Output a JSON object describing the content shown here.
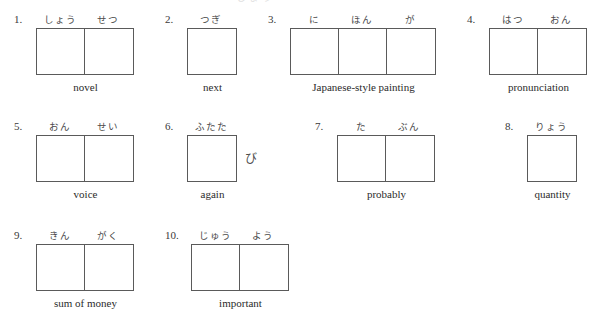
{
  "page": {
    "top_clipped_text": "しょう",
    "cell_width_px": 48,
    "cell_height_px": 45,
    "border_color": "#5a5a5a",
    "background_color": "#ffffff",
    "text_color": "#2b2b2b"
  },
  "items": [
    {
      "number": "1.",
      "furigana": [
        "しょう",
        "せつ"
      ],
      "cells": 2,
      "okurigana": "",
      "meaning": "novel",
      "left": 14,
      "top": 12
    },
    {
      "number": "2.",
      "furigana": [
        "つぎ"
      ],
      "cells": 1,
      "okurigana": "",
      "meaning": "next",
      "left": 165,
      "top": 12
    },
    {
      "number": "3.",
      "furigana": [
        "に",
        "ほん",
        "が"
      ],
      "cells": 3,
      "okurigana": "",
      "meaning": "Japanese-style painting",
      "left": 268,
      "top": 12
    },
    {
      "number": "4.",
      "furigana": [
        "はつ",
        "おん"
      ],
      "cells": 2,
      "okurigana": "",
      "meaning": "pronunciation",
      "left": 467,
      "top": 12
    },
    {
      "number": "5.",
      "furigana": [
        "おん",
        "せい"
      ],
      "cells": 2,
      "okurigana": "",
      "meaning": "voice",
      "left": 14,
      "top": 119
    },
    {
      "number": "6.",
      "furigana": [
        "ふたた"
      ],
      "cells": 1,
      "okurigana": "び",
      "meaning": "again",
      "left": 165,
      "top": 119
    },
    {
      "number": "7.",
      "furigana": [
        "た",
        "ぶん"
      ],
      "cells": 2,
      "okurigana": "",
      "meaning": "probably",
      "left": 315,
      "top": 119
    },
    {
      "number": "8.",
      "furigana": [
        "りょう"
      ],
      "cells": 1,
      "okurigana": "",
      "meaning": "quantity",
      "left": 505,
      "top": 119
    },
    {
      "number": "9.",
      "furigana": [
        "きん",
        "がく"
      ],
      "cells": 2,
      "okurigana": "",
      "meaning": "sum of money",
      "left": 14,
      "top": 228
    },
    {
      "number": "10.",
      "furigana": [
        "じゅう",
        "よう"
      ],
      "cells": 2,
      "okurigana": "",
      "meaning": "important",
      "left": 165,
      "top": 228
    }
  ]
}
